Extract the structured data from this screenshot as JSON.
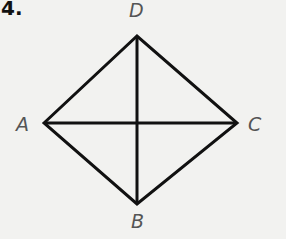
{
  "problem_number": "4.",
  "labels": {
    "A": "A",
    "B": "B",
    "C": "C",
    "D": "D"
  },
  "points": {
    "A": [
      44,
      123
    ],
    "B": [
      137,
      204
    ],
    "C": [
      237,
      123
    ],
    "D": [
      137,
      36
    ]
  },
  "stroke_color": "#111111"
}
